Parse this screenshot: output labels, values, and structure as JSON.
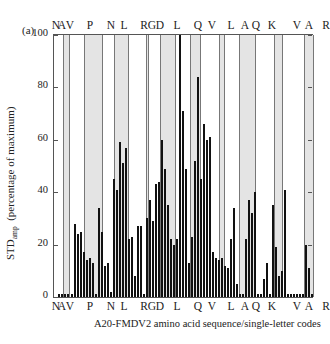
{
  "panel_label": "(a)",
  "chart_data": {
    "type": "bar",
    "title": "",
    "xlabel": "A20-FMDV2 amino acid sequence/single-letter codes",
    "ylabel_main": "STD",
    "ylabel_sub": "amp",
    "ylabel_rest": "(percentage of maximum)",
    "ylim": [
      0,
      100
    ],
    "yticks": [
      0,
      20,
      40,
      60,
      80,
      100
    ],
    "grid": false,
    "sequence_labels": [
      "N",
      "A",
      "V",
      "P",
      "N",
      "L",
      "R",
      "G",
      "D",
      "L",
      "Q",
      "V",
      "L",
      "A",
      "Q",
      "K",
      "V",
      "A",
      "R",
      "T"
    ],
    "sequence_label_x": [
      3,
      9,
      17,
      37,
      58,
      71,
      91,
      99,
      107,
      124,
      145,
      159,
      178,
      192,
      203,
      219,
      244,
      256,
      273,
      300
    ],
    "shaded_bands": [
      {
        "residue": "A",
        "x0": 9,
        "x1": 16
      },
      {
        "residue": "P",
        "x0": 30,
        "x1": 49
      },
      {
        "residue": "L",
        "x0": 60,
        "x1": 75
      },
      {
        "residue": "G",
        "x0": 92,
        "x1": 95
      },
      {
        "residue": "L",
        "x0": 106,
        "x1": 122
      },
      {
        "residue": "V",
        "x0": 136,
        "x1": 147
      },
      {
        "residue": "A",
        "x0": 165,
        "x1": 171
      },
      {
        "residue": "K",
        "x0": 185,
        "x1": 202
      },
      {
        "residue": "A",
        "x0": 220,
        "x1": 229
      },
      {
        "residue": "T",
        "x0": 250,
        "x1": 260
      }
    ],
    "bars_x": [
      4,
      7,
      10,
      13,
      17,
      20,
      23,
      26,
      29,
      32,
      35,
      38,
      41,
      44,
      47,
      50,
      53,
      56,
      59,
      62,
      65,
      68,
      71,
      74,
      77,
      80,
      83,
      86,
      89,
      92,
      95,
      98,
      101,
      104,
      107,
      110,
      113,
      116,
      119,
      122,
      125,
      128,
      131,
      134,
      137,
      140,
      143,
      146,
      149,
      152,
      155,
      158,
      161,
      164,
      167,
      170,
      173,
      176,
      179,
      182,
      185,
      188,
      191,
      194,
      197,
      200,
      203,
      206,
      209,
      212,
      215,
      218,
      221,
      224,
      227,
      230,
      233,
      236,
      239,
      242,
      245,
      248,
      251,
      254,
      257
    ],
    "values": [
      1,
      1,
      1,
      1,
      1,
      28,
      24,
      25,
      17,
      14,
      15,
      13,
      1,
      34,
      25,
      12,
      13,
      2,
      45,
      41,
      59,
      51,
      57,
      22,
      23,
      8,
      27,
      27,
      1,
      30,
      37,
      29,
      43,
      44,
      60,
      49,
      35,
      22,
      20,
      22,
      100,
      71,
      49,
      13,
      23,
      52,
      84,
      45,
      66,
      60,
      61,
      17,
      15,
      14,
      15,
      12,
      11,
      22,
      34,
      5,
      1,
      1,
      22,
      37,
      32,
      40,
      1,
      1,
      7,
      13,
      1,
      35,
      19,
      8,
      10,
      41,
      1,
      1,
      1,
      1,
      1,
      1,
      20,
      11,
      1
    ],
    "bar_color": "#111111",
    "band_color": "#e4e4e4"
  }
}
